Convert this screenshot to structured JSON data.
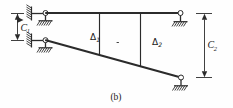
{
  "figure": {
    "caption": "(b)",
    "labels": {
      "c1_base": "C",
      "c1_sub": "1",
      "c2_base": "C",
      "c2_sub": "2",
      "delta1_base": "Δ",
      "delta1_sub": "1",
      "delta2_base": "Δ",
      "delta2_sub": "2"
    },
    "colors": {
      "ink": "#2b2b2b",
      "background": "#ffffff",
      "pin_fill": "#ffffff"
    },
    "elements": {
      "top_chord_name": "top horizontal member",
      "bottom_chord_name": "inclined bottom member",
      "vertical_1_name": "first vertical tie",
      "vertical_2_name": "second vertical tie",
      "support_upper_left": "pinned roller support on hatched wall",
      "support_lower_left": "pinned roller support on hatched wall",
      "support_upper_right": "pinned support on hatched ground",
      "support_lower_right": "pinned support on hatched ground",
      "dimension_left": "vertical dimension C1",
      "dimension_right": "vertical dimension C2"
    }
  }
}
